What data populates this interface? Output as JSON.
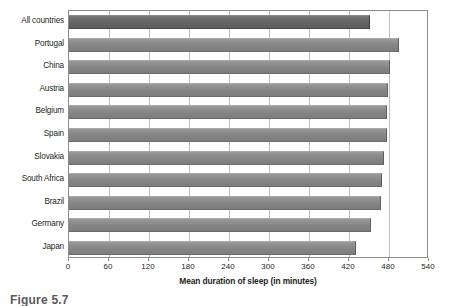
{
  "chart_data": {
    "type": "bar",
    "orientation": "horizontal",
    "title": "",
    "xlabel": "Mean duration of sleep (in minutes)",
    "ylabel": "",
    "xlim": [
      0,
      540
    ],
    "xticks": [
      0,
      60,
      120,
      180,
      240,
      300,
      360,
      420,
      480,
      540
    ],
    "xtick_labels": [
      "0",
      "60",
      "120",
      "180",
      "240",
      "300",
      "360",
      "420",
      "480",
      "540"
    ],
    "grid": true,
    "grid_axis": "x",
    "legend": null,
    "categories": [
      "All countries",
      "Portugal",
      "China",
      "Austria",
      "Belgium",
      "Spain",
      "Slovakia",
      "South Africa",
      "Brazil",
      "Germany",
      "Japan"
    ],
    "values": [
      451,
      495,
      481,
      478,
      477,
      477,
      472,
      469,
      468,
      453,
      430
    ],
    "bar_colors": [
      "#636363",
      "#8a8a8a",
      "#8a8a8a",
      "#8a8a8a",
      "#8a8a8a",
      "#8a8a8a",
      "#8a8a8a",
      "#8a8a8a",
      "#8a8a8a",
      "#8a8a8a",
      "#8a8a8a"
    ],
    "highlight_index": 0,
    "units": "minutes"
  },
  "caption": {
    "text": "Figure 5.7"
  },
  "colors": {
    "bar_fill": "#8a8a8a",
    "bar_highlight_fill": "#636363",
    "gridline": "#bfbfbf",
    "axis": "#8c8c8c",
    "text": "#231f20",
    "background": "#ffffff"
  }
}
